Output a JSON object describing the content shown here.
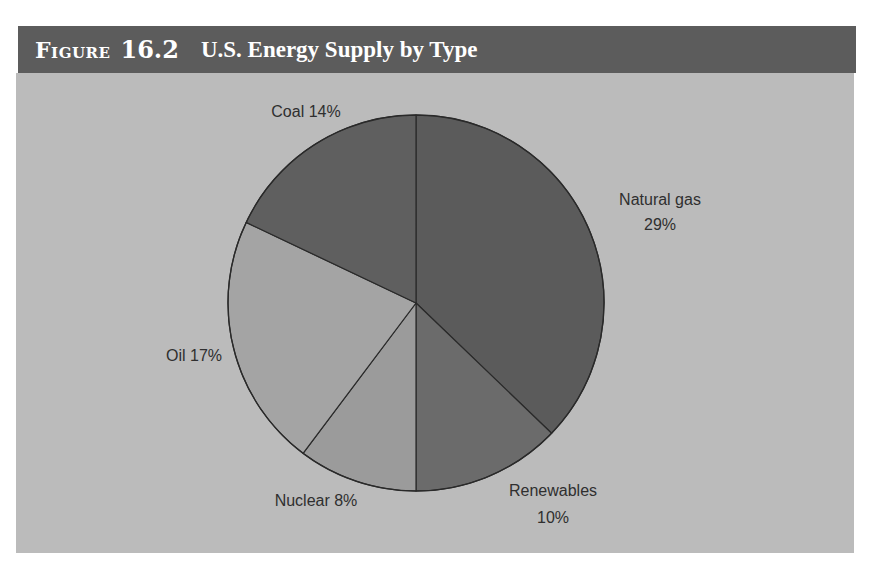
{
  "header": {
    "figure_label": "Figure",
    "figure_number": "16.2",
    "title": "U.S. Energy Supply by Type"
  },
  "colors": {
    "header_bg": "#5c5c5c",
    "panel_bg": "#bbbbbb",
    "natural_gas": "#5b5b5b",
    "renewables": "#6b6b6b",
    "nuclear": "#9b9b9b",
    "oil": "#a4a4a4",
    "coal": "#5f5f5f",
    "outline": "#2a2a2a"
  },
  "labels": {
    "natural_gas_name": "Natural gas",
    "natural_gas_pct": "29%",
    "renewables_name": "Renewables",
    "renewables_pct": "10%",
    "nuclear": "Nuclear 8%",
    "oil": "Oil 17%",
    "coal": "Coal 14%"
  },
  "chart_data": {
    "type": "pie",
    "title": "Figure 16.2 U.S. Energy Supply by Type",
    "categories": [
      "Natural gas",
      "Renewables",
      "Nuclear",
      "Oil",
      "Coal"
    ],
    "values": [
      29,
      10,
      8,
      17,
      14
    ],
    "unit": "%",
    "start_angle": "12 o'clock",
    "direction": "clockwise",
    "legend": "none (direct labels)",
    "note": "Slices are drawn proportionally to the labeled values, normalized to a full circle"
  }
}
